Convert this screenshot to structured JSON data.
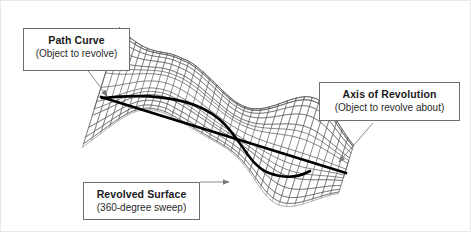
{
  "diagram": {
    "background_color": "#ffffff",
    "callouts": [
      {
        "id": "path-curve",
        "heading": "Path Curve",
        "subtext": "(Object to revolve)",
        "pointer": "arrow-down-right-to-curve"
      },
      {
        "id": "axis-of-revolution",
        "heading": "Axis of Revolution",
        "subtext": "(Object to revolve about)",
        "pointer": "arrow-down-left-to-axis"
      },
      {
        "id": "revolved-surface",
        "heading": "Revolved Surface",
        "subtext": "(360-degree sweep)",
        "pointer": "arrow-right-to-mesh"
      }
    ],
    "geometry": {
      "mesh_color": "#8b8b8b",
      "mesh_color_dark": "#5e5e5e",
      "curve_color": "#000000",
      "axis_color": "#000000",
      "arrow_color": "#7a7a7a",
      "axis_start": [
        100,
        96
      ],
      "axis_end": [
        345,
        172
      ],
      "mesh_u_lines": 34,
      "mesh_v_lines": 26
    }
  }
}
